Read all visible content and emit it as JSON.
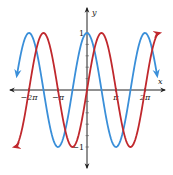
{
  "chart_data": {
    "type": "line",
    "title": "",
    "xlabel": "x",
    "ylabel": "y",
    "x_ticks": [
      {
        "value": -6.2832,
        "label": "−2π"
      },
      {
        "value": -3.1416,
        "label": "−π"
      },
      {
        "value": 3.1416,
        "label": "π"
      },
      {
        "value": 6.2832,
        "label": "2π"
      }
    ],
    "y_ticks": [
      {
        "value": 1,
        "label": "1"
      },
      {
        "value": -1,
        "label": "−1"
      }
    ],
    "y_minor_tick_step": 0.2,
    "xlim": [
      -8.6,
      8.6
    ],
    "ylim": [
      -1.35,
      1.45
    ],
    "grid": false,
    "legend": null,
    "series": [
      {
        "name": "y = cos x",
        "color": "#3a8fd9",
        "function": "cos",
        "domain": [
          -7.6,
          7.6
        ],
        "key_points": [
          {
            "x": -6.2832,
            "y": 1
          },
          {
            "x": -3.1416,
            "y": -1
          },
          {
            "x": 0,
            "y": 1
          },
          {
            "x": 3.1416,
            "y": -1
          },
          {
            "x": 6.2832,
            "y": 1
          }
        ],
        "arrows_at_ends": true
      },
      {
        "name": "y = sin x",
        "color": "#c0282d",
        "function": "sin",
        "domain": [
          -7.85,
          7.85
        ],
        "key_points": [
          {
            "x": -4.7124,
            "y": 1
          },
          {
            "x": -1.5708,
            "y": -1
          },
          {
            "x": 0,
            "y": 0
          },
          {
            "x": 1.5708,
            "y": 1
          },
          {
            "x": 4.7124,
            "y": -1
          },
          {
            "x": 7.854,
            "y": 1
          }
        ],
        "arrows_at_ends": true
      }
    ]
  },
  "layout": {
    "origin_px": [
      87,
      90
    ],
    "px_per_pi": 29,
    "px_per_unit_y": 57
  }
}
